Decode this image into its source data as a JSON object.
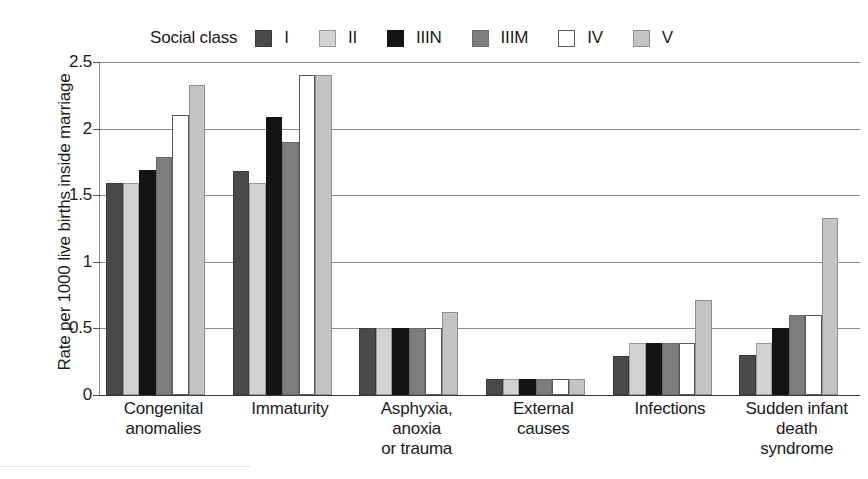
{
  "legend": {
    "title": "Social class",
    "position": "top",
    "items": [
      {
        "label": "I",
        "color": "#4a4a4a",
        "border": "#3a3a3a"
      },
      {
        "label": "II",
        "color": "#d2d2d2",
        "border": "#9a9a9a"
      },
      {
        "label": "IIIN",
        "color": "#141414",
        "border": "#141414"
      },
      {
        "label": "IIIM",
        "color": "#7d7d7d",
        "border": "#6a6a6a"
      },
      {
        "label": "IV",
        "color": "#ffffff",
        "border": "#5a5a5a"
      },
      {
        "label": "V",
        "color": "#c4c4c4",
        "border": "#8d8d8d"
      }
    ]
  },
  "axes": {
    "ylabel": "Rate per 1000 live births inside marriage",
    "xlabel": "",
    "yticks": [
      "0",
      "0.5",
      "1",
      "1.5",
      "2",
      "2.5"
    ]
  },
  "chart_data": {
    "type": "bar",
    "title": "",
    "xlabel": "",
    "ylabel": "Rate per 1000 live births inside marriage",
    "ylim": [
      0,
      2.5
    ],
    "ytick_values": [
      0,
      0.5,
      1,
      1.5,
      2,
      2.5
    ],
    "grid": true,
    "legend_position": "top",
    "legend_title": "Social class",
    "categories": [
      "Congenital\nanomalies",
      "Immaturity",
      "Asphyxia,\nanoxia\nor trauma",
      "External\ncauses",
      "Infections",
      "Sudden infant\ndeath\nsyndrome"
    ],
    "category_lines": [
      [
        "Congenital",
        "anomalies"
      ],
      [
        "Immaturity"
      ],
      [
        "Asphyxia,",
        "anoxia",
        "or trauma"
      ],
      [
        "External",
        "causes"
      ],
      [
        "Infections"
      ],
      [
        "Sudden infant",
        "death",
        "syndrome"
      ]
    ],
    "series": [
      {
        "name": "I",
        "color": "#4a4a4a",
        "border": "#3a3a3a",
        "values": [
          1.59,
          1.68,
          0.5,
          0.12,
          0.29,
          0.3
        ]
      },
      {
        "name": "II",
        "color": "#d2d2d2",
        "border": "#9a9a9a",
        "values": [
          1.59,
          1.59,
          0.5,
          0.12,
          0.39,
          0.39
        ]
      },
      {
        "name": "IIIN",
        "color": "#141414",
        "border": "#141414",
        "values": [
          1.69,
          2.09,
          0.5,
          0.12,
          0.39,
          0.5
        ]
      },
      {
        "name": "IIIM",
        "color": "#7d7d7d",
        "border": "#6a6a6a",
        "values": [
          1.79,
          1.9,
          0.5,
          0.12,
          0.39,
          0.6
        ]
      },
      {
        "name": "IV",
        "color": "#ffffff",
        "border": "#5a5a5a",
        "values": [
          2.1,
          2.4,
          0.5,
          0.12,
          0.39,
          0.6
        ]
      },
      {
        "name": "V",
        "color": "#c4c4c4",
        "border": "#8d8d8d",
        "values": [
          2.33,
          2.4,
          0.62,
          0.12,
          0.71,
          1.33
        ]
      }
    ]
  }
}
